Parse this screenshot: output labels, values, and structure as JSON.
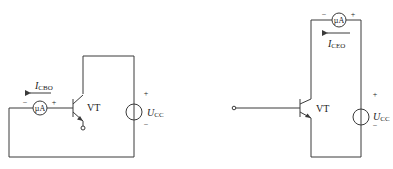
{
  "diagrams": [
    {
      "id": "icbo",
      "transistor_label": "VT",
      "meter_label": "µA",
      "meter_plus": "+",
      "meter_minus": "−",
      "current_label_main": "I",
      "current_label_sub": "CBO",
      "source_label_main": "U",
      "source_label_sub": "CC",
      "source_plus": "+",
      "source_minus": "−"
    },
    {
      "id": "iceo",
      "transistor_label": "VT",
      "meter_label": "µA",
      "meter_plus": "+",
      "meter_minus": "−",
      "current_label_main": "I",
      "current_label_sub": "CEO",
      "source_label_main": "U",
      "source_label_sub": "CC",
      "source_plus": "+",
      "source_minus": "−"
    }
  ],
  "colors": {
    "line": "#3a3a3a",
    "text": "#222222",
    "background": "#ffffff"
  }
}
